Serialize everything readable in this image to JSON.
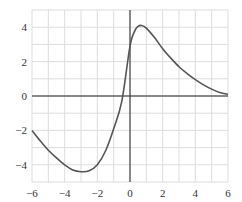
{
  "chart_data": {
    "type": "line",
    "title": "",
    "xlabel": "",
    "ylabel": "",
    "xlim": [
      -6,
      6
    ],
    "ylim": [
      -5,
      5
    ],
    "grid": true,
    "grid_step_x": 1,
    "grid_step_y": 1,
    "legend": null,
    "x_ticks": [
      -6,
      -4,
      -2,
      0,
      2,
      4,
      6
    ],
    "y_ticks": [
      -4,
      -2,
      0,
      2,
      4
    ],
    "x_tick_labels": [
      "−6",
      "−4",
      "−2",
      "0",
      "2",
      "4",
      "6"
    ],
    "y_tick_labels": [
      "−4",
      "−2",
      "0",
      "2",
      "4"
    ],
    "series": [
      {
        "name": "f(x)",
        "color": "#555555",
        "x": [
          -6,
          -5.5,
          -5,
          -4.5,
          -4,
          -3.5,
          -3,
          -2.5,
          -2,
          -1.5,
          -1,
          -0.5,
          0,
          0.3,
          0.5,
          0.7,
          1,
          1.5,
          2,
          2.5,
          3,
          3.5,
          4,
          4.5,
          5,
          5.5,
          6
        ],
        "y": [
          -2.0,
          -2.6,
          -3.15,
          -3.6,
          -4.0,
          -4.3,
          -4.4,
          -4.35,
          -4.0,
          -3.2,
          -1.9,
          -0.3,
          2.9,
          3.8,
          4.05,
          4.1,
          3.95,
          3.4,
          2.75,
          2.2,
          1.7,
          1.3,
          0.95,
          0.65,
          0.4,
          0.2,
          0.1
        ]
      }
    ]
  },
  "colors": {
    "grid": "#dddddd",
    "axis": "#222222",
    "curve": "#555555",
    "background": "#ffffff"
  }
}
